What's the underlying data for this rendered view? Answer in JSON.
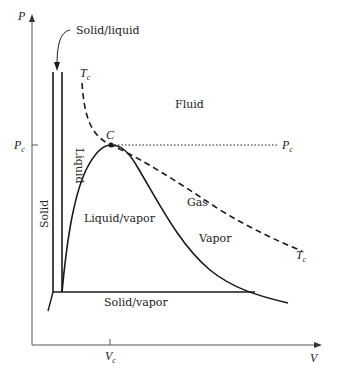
{
  "diagram": {
    "axes": {
      "y_label": "P",
      "x_label": "V",
      "y_tick_label": "P",
      "y_tick_sub": "c",
      "x_tick_label": "V",
      "x_tick_sub": "c"
    },
    "labels": {
      "solid_liquid": "Solid/liquid",
      "tc_top": "T",
      "tc_top_sub": "c",
      "fluid": "Fluid",
      "critical_point": "C",
      "pc_right": "P",
      "pc_right_sub": "c",
      "liquid": "Liquid",
      "solid": "Solid",
      "gas": "Gas",
      "liquid_vapor": "Liquid/vapor",
      "vapor": "Vapor",
      "tc_right": "T",
      "tc_right_sub": "c",
      "solid_vapor": "Solid/vapor"
    },
    "colors": {
      "line": "#1a1a1a",
      "axis": "#555555",
      "text": "#222222"
    }
  }
}
